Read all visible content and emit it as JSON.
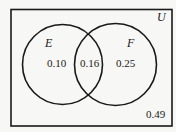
{
  "diagram": {
    "type": "venn",
    "colors": {
      "background": "#f7f7f5",
      "stroke": "#1a1a1a"
    },
    "universe": {
      "label": "U",
      "outside_value": "0.49"
    },
    "sets": [
      {
        "label": "E",
        "only_value": "0.10"
      },
      {
        "label": "F",
        "only_value": "0.25"
      }
    ],
    "intersection": {
      "sets": [
        "E",
        "F"
      ],
      "value": "0.16"
    }
  }
}
